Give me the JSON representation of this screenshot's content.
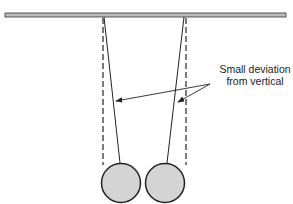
{
  "diagram": {
    "annotation": {
      "line1": "Small deviation",
      "line2": "from vertical"
    },
    "colors": {
      "bob_fill": "#d4d4d4",
      "stroke": "#222222",
      "bar_fill": "#bdbdbd"
    },
    "elements": [
      "support-bar",
      "left-pendulum",
      "right-pendulum",
      "vertical-reference-lines",
      "annotation-arrows"
    ]
  }
}
